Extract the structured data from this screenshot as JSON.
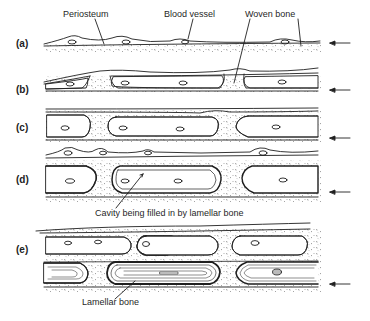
{
  "figure": {
    "colors": {
      "ink": "#1f1f1f",
      "background": "#ffffff",
      "stipple": "#555555"
    },
    "annotations": {
      "periosteum": "Periosteum",
      "blood_vessel": "Blood vessel",
      "woven_bone": "Woven bone",
      "cavity_filling": "Cavity being filled in by lamellar bone",
      "lamellar_bone": "Lamellar bone"
    },
    "stages": [
      {
        "id": "a",
        "label": "(a)",
        "arrow": "arrow-left-icon"
      },
      {
        "id": "b",
        "label": "(b)",
        "arrow": "arrow-left-icon"
      },
      {
        "id": "c",
        "label": "(c)",
        "arrow": "arrow-left-icon"
      },
      {
        "id": "d",
        "label": "(d)",
        "arrow": "arrow-left-icon"
      },
      {
        "id": "e",
        "label": "(e)",
        "arrow": "arrow-left-icon"
      }
    ]
  }
}
